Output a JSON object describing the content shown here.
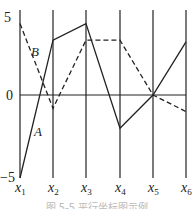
{
  "chart_data": {
    "type": "line",
    "subtype": "parallel-coordinates",
    "title": "",
    "caption": "图 5-5 平行坐标图示例",
    "categories": [
      "x1",
      "x2",
      "x3",
      "x4",
      "x5",
      "x6"
    ],
    "series": [
      {
        "name": "A",
        "style": "solid",
        "values": [
          -5,
          3.3,
          4.3,
          -2,
          0,
          3.2
        ]
      },
      {
        "name": "B",
        "style": "dashed",
        "values": [
          4.3,
          -0.8,
          3.3,
          3.3,
          0,
          -1
        ]
      }
    ],
    "ylim": [
      -5,
      5
    ],
    "yticks": [
      "5",
      "0",
      "−5"
    ],
    "xlabel": "",
    "ylabel": "",
    "grid": false,
    "legend": "inline labels"
  },
  "labels": {
    "ytick_top": "5",
    "ytick_mid": "0",
    "ytick_bottom": "−5",
    "series_a": "A",
    "series_b": "B",
    "axes": [
      {
        "main": "x",
        "sub": "1"
      },
      {
        "main": "x",
        "sub": "2"
      },
      {
        "main": "x",
        "sub": "3"
      },
      {
        "main": "x",
        "sub": "4"
      },
      {
        "main": "x",
        "sub": "5"
      },
      {
        "main": "x",
        "sub": "6"
      }
    ],
    "caption": "图 5-5 平行坐标图示例"
  }
}
